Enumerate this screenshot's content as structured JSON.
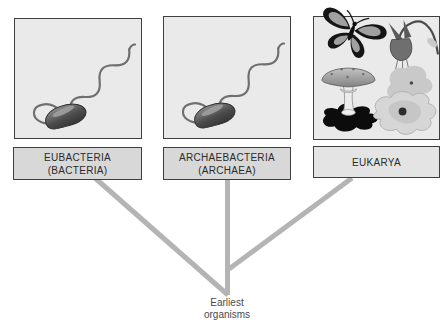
{
  "figure": {
    "panels": [
      {
        "label_lines": [
          "EUBACTERIA",
          "(BACTERIA)"
        ],
        "illustration": "spirillum-bacterium-with-flagellum"
      },
      {
        "label_lines": [
          "ARCHAEBACTERIA",
          "(ARCHAEA)"
        ],
        "illustration": "spirillum-bacterium-with-flagellum"
      },
      {
        "label_lines": [
          "EUKARYA"
        ],
        "illustration": "butterfly-columbine-flower-mushroom-amoeba",
        "icons": [
          "butterfly",
          "columbine-flower",
          "mushroom",
          "amoeba"
        ]
      }
    ],
    "root_label_lines": [
      "Earliest",
      "organisms"
    ],
    "colors": {
      "background": "#ffffff",
      "branch_line": "#b4b4b4",
      "panel_fill": "#eaeaea",
      "label_fill": "#d8d8d8",
      "eukarya_label_fill": "#e4e4e4",
      "box_border": "#3f3f3f",
      "label_text": "#2b2b2b",
      "root_text": "#4a4a4a"
    }
  }
}
